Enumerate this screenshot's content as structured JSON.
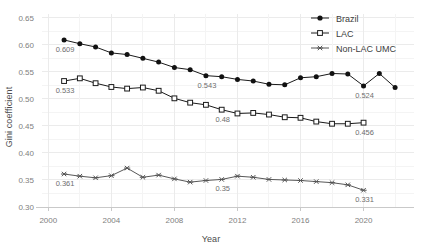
{
  "chart_data": {
    "type": "line",
    "title": "",
    "xlabel": "Year",
    "ylabel": "Gini coefficient",
    "xlim": [
      1999.6,
      2023.2
    ],
    "ylim": [
      0.3,
      0.657
    ],
    "grid": true,
    "legend_position": "top-right",
    "xticks": [
      "2000",
      "2004",
      "2008",
      "2012",
      "2016",
      "2020"
    ],
    "xtick_values": [
      2000,
      2004,
      2008,
      2012,
      2016,
      2020
    ],
    "yticks": [
      "0.30",
      "0.35",
      "0.40",
      "0.45",
      "0.50",
      "0.55",
      "0.60",
      "0.65"
    ],
    "ytick_values": [
      0.3,
      0.35,
      0.4,
      0.45,
      0.5,
      0.55,
      0.6,
      0.65
    ],
    "series": [
      {
        "name": "Brazil",
        "marker": "filled-circle",
        "x": [
          2001,
          2002,
          2003,
          2004,
          2005,
          2006,
          2007,
          2008,
          2009,
          2010,
          2011,
          2012,
          2013,
          2014,
          2015,
          2016,
          2017,
          2018,
          2019,
          2020,
          2021,
          2022
        ],
        "values": [
          0.609,
          0.602,
          0.596,
          0.585,
          0.582,
          0.575,
          0.568,
          0.558,
          0.554,
          0.543,
          0.541,
          0.536,
          0.533,
          0.527,
          0.526,
          0.539,
          0.541,
          0.547,
          0.546,
          0.524,
          0.547,
          0.521
        ]
      },
      {
        "name": "LAC",
        "marker": "open-square",
        "x": [
          2001,
          2002,
          2003,
          2004,
          2005,
          2006,
          2007,
          2008,
          2009,
          2010,
          2011,
          2012,
          2013,
          2014,
          2015,
          2016,
          2017,
          2018,
          2019,
          2020
        ],
        "values": [
          0.533,
          0.538,
          0.529,
          0.522,
          0.519,
          0.521,
          0.515,
          0.501,
          0.493,
          0.489,
          0.48,
          0.473,
          0.474,
          0.471,
          0.466,
          0.465,
          0.458,
          0.454,
          0.454,
          0.456
        ]
      },
      {
        "name": "Non-LAC UMC",
        "marker": "star",
        "x": [
          2001,
          2002,
          2003,
          2004,
          2005,
          2006,
          2007,
          2008,
          2009,
          2010,
          2011,
          2012,
          2013,
          2014,
          2015,
          2016,
          2017,
          2018,
          2019,
          2020
        ],
        "values": [
          0.361,
          0.357,
          0.354,
          0.358,
          0.372,
          0.355,
          0.359,
          0.352,
          0.346,
          0.349,
          0.351,
          0.357,
          0.355,
          0.351,
          0.35,
          0.349,
          0.347,
          0.345,
          0.341,
          0.331
        ]
      }
    ],
    "annotations": [
      {
        "text": "0.609",
        "x": 2001,
        "y": 0.609,
        "series": "Brazil"
      },
      {
        "text": "0.543",
        "x": 2010,
        "y": 0.543,
        "series": "Brazil"
      },
      {
        "text": "0.524",
        "x": 2020,
        "y": 0.524,
        "series": "Brazil"
      },
      {
        "text": "0.533",
        "x": 2001,
        "y": 0.533,
        "series": "LAC"
      },
      {
        "text": "0.48",
        "x": 2011,
        "y": 0.48,
        "series": "LAC"
      },
      {
        "text": "0.456",
        "x": 2020,
        "y": 0.456,
        "series": "LAC"
      },
      {
        "text": "0.361",
        "x": 2001,
        "y": 0.361,
        "series": "Non-LAC UMC"
      },
      {
        "text": "0.35",
        "x": 2011,
        "y": 0.351,
        "series": "Non-LAC UMC"
      },
      {
        "text": "0.331",
        "x": 2020,
        "y": 0.331,
        "series": "Non-LAC UMC"
      }
    ],
    "legend": [
      {
        "label": "Brazil",
        "marker": "filled-circle"
      },
      {
        "label": "LAC",
        "marker": "open-square"
      },
      {
        "label": "Non-LAC UMC",
        "marker": "star"
      }
    ],
    "colors": {
      "line": "#1a1a1a",
      "grid": "#ebebeb",
      "axis": "#c9c9c9",
      "text": "#4d4d4d",
      "tick_text": "#808080",
      "annotation_text": "#6e6e6e",
      "background": "#ffffff"
    }
  }
}
